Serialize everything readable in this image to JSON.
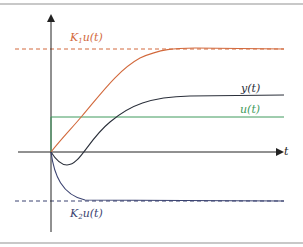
{
  "figure": {
    "frame_color": "#c8c8c8",
    "axis_color": "#222222",
    "x_axis_label": "t",
    "curves": {
      "k1": {
        "label_main": "K",
        "label_sub": "1",
        "label_rest": "u(t)",
        "color": "#d2693c",
        "asymptote_color": "#d2693c"
      },
      "y": {
        "label": "y(t)",
        "color": "#2a2f3a"
      },
      "u": {
        "label": "u(t)",
        "color": "#3e9a5c"
      },
      "k2": {
        "label_main": "K",
        "label_sub": "2",
        "label_rest": "u(t)",
        "color": "#3a4270",
        "asymptote_color": "#3a4270"
      }
    }
  }
}
